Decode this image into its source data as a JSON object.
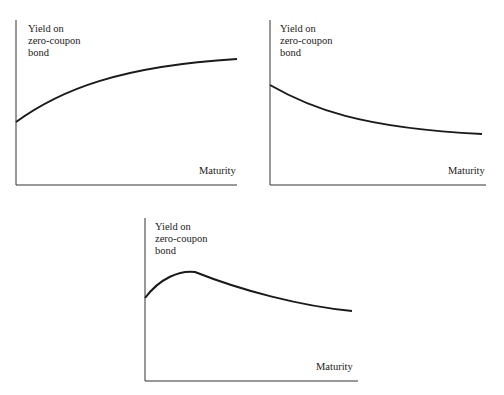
{
  "panels": [
    {
      "ylabel_lines": [
        "Yield on",
        "zero-coupon",
        "bond"
      ],
      "xlabel": "Maturity",
      "shape": "upward sloping"
    },
    {
      "ylabel_lines": [
        "Yield on",
        "zero-coupon",
        "bond"
      ],
      "xlabel": "Maturity",
      "shape": "downward sloping"
    },
    {
      "ylabel_lines": [
        "Yield on",
        "zero-coupon",
        "bond"
      ],
      "xlabel": "Maturity",
      "shape": "humped"
    }
  ],
  "colors": {
    "line": "#1a1a1a",
    "axis": "#333333",
    "background": "#ffffff"
  }
}
